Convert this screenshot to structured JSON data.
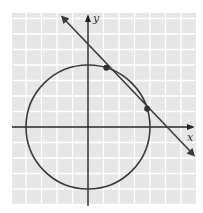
{
  "figure": {
    "axes": {
      "x_label": "x",
      "y_label": "y"
    },
    "colors": {
      "grid_background": "#e6e6e6",
      "grid_lines": "#ffffff",
      "axis": "#222222",
      "curve": "#3a3a3a",
      "points": "#333333"
    },
    "grid": {
      "unit_px": 15.5,
      "x_range": [
        -5,
        7
      ],
      "y_range": [
        -5,
        7
      ]
    },
    "circle": {
      "equation": "x^2 + y^2 = 16",
      "center": [
        0,
        0
      ],
      "radius": 4
    },
    "line": {
      "equation": "x + y = 5",
      "slope": -1,
      "intercept": 5
    },
    "intersection_points": [
      {
        "x": 1.18,
        "y": 3.82
      },
      {
        "x": 3.82,
        "y": 1.18
      }
    ]
  },
  "chart_data": {
    "type": "line",
    "title": "",
    "xlabel": "x",
    "ylabel": "y",
    "grid": true,
    "xlim": [
      -5,
      7
    ],
    "ylim": [
      -5,
      7
    ],
    "series": [
      {
        "name": "circle",
        "equation": "x^2 + y^2 = 16",
        "center": [
          0,
          0
        ],
        "radius": 4
      },
      {
        "name": "line",
        "equation": "x + y = 5",
        "x": [
          -1.3,
          6.9
        ],
        "y": [
          6.3,
          -1.9
        ]
      }
    ],
    "points": [
      {
        "x": 1.18,
        "y": 3.82
      },
      {
        "x": 3.82,
        "y": 1.18
      }
    ],
    "tick_labels": "none shown"
  }
}
